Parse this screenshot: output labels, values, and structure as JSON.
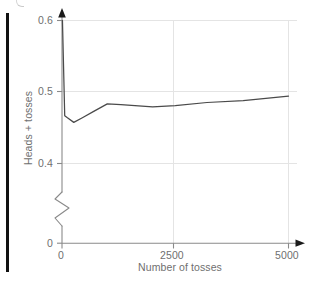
{
  "figure": {
    "page_edge_bar_color": "#111111",
    "line_color": "#4a4a4a",
    "grid_color": "#e2e2e2",
    "axis_color": "#8a8a8a",
    "text_color": "#6f6f6f",
    "background": "#ffffff"
  },
  "chart_data": {
    "type": "line",
    "title": "",
    "xlabel": "Number of tosses",
    "ylabel": "Heads + tosses",
    "xlim": [
      0,
      5000
    ],
    "ylim": [
      0.385,
      0.605
    ],
    "y_axis_break": true,
    "y_axis_break_note": "zigzag break between 0 and 0.4",
    "grid": true,
    "legend": null,
    "xticks": [
      0,
      2500,
      5000
    ],
    "xticklabels": [
      "0",
      "2500",
      "5000"
    ],
    "yticks": [
      0,
      0.4,
      0.5,
      0.6
    ],
    "yticklabels": [
      "0",
      "0.4",
      "0.5",
      "0.6"
    ],
    "series": [
      {
        "name": "Heads + tosses",
        "x": [
          10,
          60,
          120,
          260,
          450,
          700,
          1000,
          1300,
          2000,
          2500,
          3200,
          4000,
          5000
        ],
        "values": [
          0.6,
          0.466,
          0.463,
          0.4565,
          0.463,
          0.472,
          0.4825,
          0.4815,
          0.4785,
          0.48,
          0.4845,
          0.487,
          0.4935
        ]
      }
    ]
  },
  "axes": {
    "y_tick_labels": [
      "0.6",
      "0.5",
      "0.4",
      "0"
    ],
    "x_tick_labels": [
      "0",
      "2500",
      "5000"
    ],
    "x_title": "Number of tosses",
    "y_title": "Heads + tosses"
  }
}
